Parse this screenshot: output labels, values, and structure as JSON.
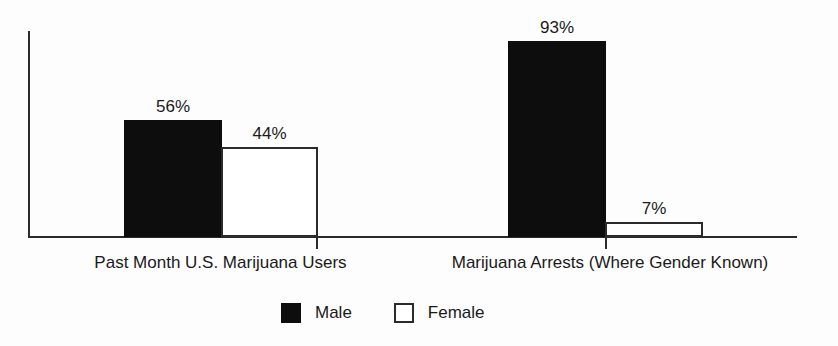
{
  "chart_data": {
    "type": "bar",
    "title": "",
    "subtitle": "",
    "xlabel": "",
    "ylabel": "",
    "grid": false,
    "legend_position": "bottom-center",
    "ylim": [
      0,
      100
    ],
    "categories": [
      "Past Month U.S. Marijuana Users",
      "Marijuana Arrests (Where Gender Known)"
    ],
    "series": [
      {
        "name": "Male",
        "color": "#0d0d0d",
        "values": [
          56,
          93
        ],
        "labels": [
          "56%",
          "93%"
        ]
      },
      {
        "name": "Female",
        "color": "#ffffff",
        "values": [
          44,
          7
        ],
        "labels": [
          "44%",
          "7%"
        ]
      }
    ]
  },
  "axes": {
    "line_color": "#2b2b2b"
  },
  "legend": {
    "items": [
      {
        "label": "Male",
        "swatch": "filled-black-square"
      },
      {
        "label": "Female",
        "swatch": "outlined-white-square"
      }
    ]
  }
}
